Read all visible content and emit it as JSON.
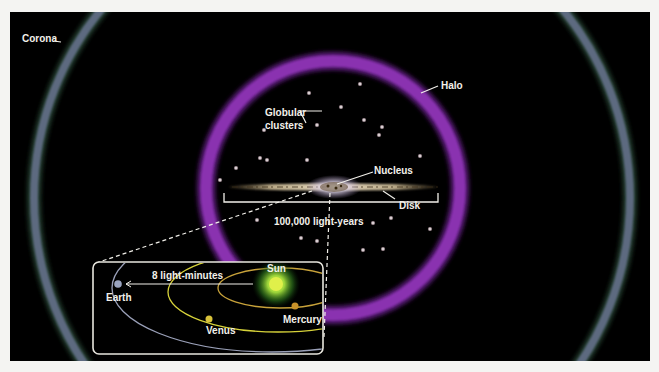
{
  "diagram": {
    "labels": {
      "corona": "Corona",
      "halo": "Halo",
      "globular_clusters_line1": "Globular",
      "globular_clusters_line2": "clusters",
      "nucleus": "Nucleus",
      "disk": "Disk",
      "scale": "100,000 light-years"
    },
    "inset": {
      "distance_label": "8 light-minutes",
      "bodies": [
        {
          "name": "Sun",
          "color": "#d9ef3a"
        },
        {
          "name": "Mercury",
          "color": "#c8912a"
        },
        {
          "name": "Venus",
          "color": "#d8c23a"
        },
        {
          "name": "Earth",
          "color": "#9aa4c0"
        }
      ],
      "orbit_colors": {
        "mercury": "#c8a23a",
        "venus": "#d6d23a",
        "earth": "#9aa0b8"
      }
    },
    "colors": {
      "background": "#000000",
      "corona": "#5d6a80",
      "halo": "#8a33b0",
      "text": "#f2f0ea",
      "globular_cluster": "#e8d6dc"
    }
  }
}
